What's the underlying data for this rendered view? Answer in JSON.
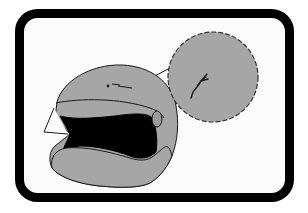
{
  "figure": {
    "colors": {
      "background": "#ffffff",
      "frame": "#000000",
      "frame_inner": "#fbfbfb",
      "helmet_shell": "#a6a6a6",
      "visor_opening": "#000000",
      "outline": "#1a1a1a",
      "callout_fill": "#a6a6a6"
    },
    "elements": [
      {
        "name": "rounded-frame",
        "label": "Rounded black border frame"
      },
      {
        "name": "helmet",
        "label": "Helmet shell (side view)"
      },
      {
        "name": "visor-opening",
        "label": "Black face/visor opening"
      },
      {
        "name": "visor-flap",
        "label": "Raised visor outline"
      },
      {
        "name": "side-vent",
        "label": "Oval side pivot"
      },
      {
        "name": "crack-mark",
        "label": "Small crack on helmet shell"
      },
      {
        "name": "magnified-callout",
        "label": "Dashed magnifier circle showing crack"
      },
      {
        "name": "callout-leader-lines",
        "label": "Leader lines from crack to magnifier"
      }
    ]
  }
}
